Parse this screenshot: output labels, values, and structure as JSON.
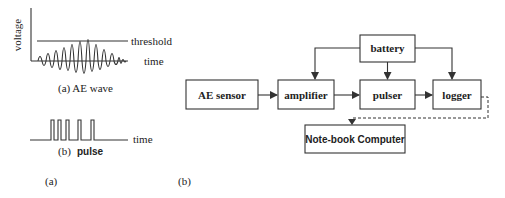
{
  "panel_a": {
    "caption": "(a)",
    "ae_wave": {
      "y_axis_label": "voltage",
      "threshold_label": "threshold",
      "time_label": "time",
      "caption": "(a) AE wave"
    },
    "pulse": {
      "time_label": "time",
      "caption_prefix": "(b)",
      "caption_word": "pulse",
      "pulse_count": 5
    }
  },
  "panel_b": {
    "caption": "(b)",
    "blocks": {
      "ae_sensor": "AE sensor",
      "amplifier": "amplifier",
      "pulser": "pulser",
      "logger": "logger",
      "battery": "battery",
      "notebook": "Note-book Computer"
    },
    "connections": [
      {
        "from": "AE sensor",
        "to": "amplifier",
        "style": "solid"
      },
      {
        "from": "amplifier",
        "to": "pulser",
        "style": "solid"
      },
      {
        "from": "pulser",
        "to": "logger",
        "style": "solid"
      },
      {
        "from": "battery",
        "to": "amplifier",
        "style": "solid"
      },
      {
        "from": "battery",
        "to": "pulser",
        "style": "solid"
      },
      {
        "from": "battery",
        "to": "logger",
        "style": "solid"
      },
      {
        "from": "logger",
        "to": "Note-book Computer",
        "style": "dashed"
      }
    ]
  }
}
